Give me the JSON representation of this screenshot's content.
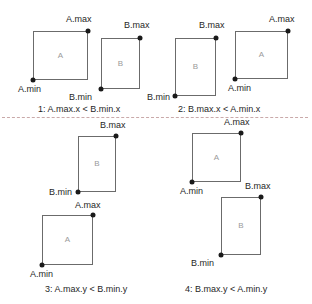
{
  "figure": {
    "background_color": "#ffffff",
    "rect_stroke_color": "#6b6b6b",
    "dot_color": "#1a1a1a",
    "text_color": "#1f1f1f",
    "rect_label_color": "#9a9a9a",
    "divider_color": "#c9a9a9"
  },
  "cases": [
    {
      "id": "case-1",
      "caption": "1: A.max.x < B.min.x",
      "rects": [
        {
          "name": "A",
          "label": "A",
          "x": 33,
          "y": 31,
          "w": 55,
          "h": 49
        },
        {
          "name": "B",
          "label": "B",
          "x": 101,
          "y": 38,
          "w": 39,
          "h": 51
        }
      ],
      "points": [
        {
          "name": "A.max",
          "label": "A.max",
          "x": 88,
          "y": 31
        },
        {
          "name": "A.min",
          "label": "A.min",
          "x": 33,
          "y": 80
        },
        {
          "name": "B.max",
          "label": "B.max",
          "x": 140,
          "y": 38
        },
        {
          "name": "B.min",
          "label": "B.min",
          "x": 101,
          "y": 89
        }
      ]
    },
    {
      "id": "case-2",
      "caption": "2: B.max.x < A.min.x",
      "rects": [
        {
          "name": "B",
          "label": "B",
          "x": 175,
          "y": 38,
          "w": 41,
          "h": 58
        },
        {
          "name": "A",
          "label": "A",
          "x": 235,
          "y": 31,
          "w": 53,
          "h": 48
        }
      ],
      "points": [
        {
          "name": "B.max",
          "label": "B.max",
          "x": 216,
          "y": 38
        },
        {
          "name": "B.min",
          "label": "B.min",
          "x": 175,
          "y": 96
        },
        {
          "name": "A.max",
          "label": "A.max",
          "x": 288,
          "y": 31
        },
        {
          "name": "A.min",
          "label": "A.min",
          "x": 235,
          "y": 79
        }
      ]
    },
    {
      "id": "case-3",
      "caption": "3: A.max.y < B.min.y",
      "rects": [
        {
          "name": "B",
          "label": "B",
          "x": 78,
          "y": 136,
          "w": 38,
          "h": 56
        },
        {
          "name": "A",
          "label": "A",
          "x": 42,
          "y": 215,
          "w": 51,
          "h": 50
        }
      ],
      "points": [
        {
          "name": "B.max",
          "label": "B.max",
          "x": 116,
          "y": 136
        },
        {
          "name": "B.min",
          "label": "B.min",
          "x": 78,
          "y": 192
        },
        {
          "name": "A.max",
          "label": "A.max",
          "x": 93,
          "y": 215
        },
        {
          "name": "A.min",
          "label": "A.min",
          "x": 42,
          "y": 265
        }
      ]
    },
    {
      "id": "case-4",
      "caption": "4: B.max.y < A.min.y",
      "rects": [
        {
          "name": "A",
          "label": "A",
          "x": 192,
          "y": 133,
          "w": 49,
          "h": 49
        },
        {
          "name": "B",
          "label": "B",
          "x": 221,
          "y": 197,
          "w": 40,
          "h": 58
        }
      ],
      "points": [
        {
          "name": "A.max",
          "label": "A.max",
          "x": 241,
          "y": 133
        },
        {
          "name": "A.min",
          "label": "A.min",
          "x": 192,
          "y": 182
        },
        {
          "name": "B.max",
          "label": "B.max",
          "x": 261,
          "y": 197
        },
        {
          "name": "B.min",
          "label": "B.min",
          "x": 221,
          "y": 255
        }
      ]
    }
  ],
  "labels": {
    "case1": {
      "a_max": "A.max",
      "a_min": "A.min",
      "b_max": "B.max",
      "b_min": "B.min",
      "rect_a": "A",
      "rect_b": "B",
      "caption": "1: A.max.x < B.min.x"
    },
    "case2": {
      "b_max": "B.max",
      "b_min": "B.min",
      "a_max": "A.max",
      "a_min": "A.min",
      "rect_a": "A",
      "rect_b": "B",
      "caption": "2: B.max.x < A.min.x"
    },
    "case3": {
      "b_max": "B.max",
      "b_min": "B.min",
      "a_max": "A.max",
      "a_min": "A.min",
      "rect_a": "A",
      "rect_b": "B",
      "caption": "3: A.max.y < B.min.y"
    },
    "case4": {
      "a_max": "A.max",
      "a_min": "A.min",
      "b_max": "B.max",
      "b_min": "B.min",
      "rect_a": "A",
      "rect_b": "B",
      "caption": "4: B.max.y < A.min.y"
    }
  }
}
